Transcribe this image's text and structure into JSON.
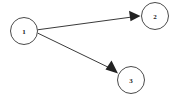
{
  "canvas": {
    "width": 176,
    "height": 97,
    "background_color": "#ffffff"
  },
  "graph": {
    "type": "directed-graph",
    "node_stroke_color": "#4a4a4a",
    "node_fill_color": "#ffffff",
    "node_stroke_width": 1,
    "node_radius": 13.5,
    "edge_color": "#3a3a3a",
    "edge_stroke_width": 1,
    "label_color": "#1a1a1a",
    "nodes": [
      {
        "id": "1",
        "label": "1",
        "cx": 24,
        "cy": 31,
        "r": 13.5
      },
      {
        "id": "2",
        "label": "2",
        "cx": 155,
        "cy": 16,
        "r": 13.5
      },
      {
        "id": "3",
        "label": "3",
        "cx": 131,
        "cy": 80,
        "r": 13.5
      }
    ],
    "edges": [
      {
        "id": "edge-1-2",
        "from": "1",
        "to": "2",
        "label": "",
        "directed": true,
        "x1": 37.5,
        "y1": 29.8,
        "x2": 140,
        "y2": 15.9
      },
      {
        "id": "edge-1-3",
        "from": "1",
        "to": "3",
        "label": "",
        "directed": true,
        "x1": 37.5,
        "y1": 33.0,
        "x2": 117,
        "y2": 71.5
      }
    ],
    "arrowheads": [
      {
        "id": "arrowhead-1-2",
        "points": "140,16 130,11 130,21",
        "color": "#222222"
      },
      {
        "id": "arrowhead-1-3",
        "points": "117,72 106,69 111,61",
        "color": "#222222"
      }
    ]
  }
}
